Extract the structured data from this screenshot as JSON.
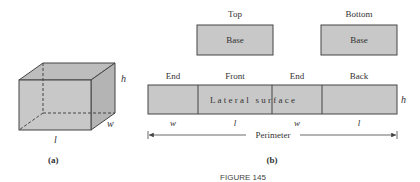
{
  "figure": {
    "caption": "FIGURE 145",
    "colors": {
      "fill": "#c8c8c8",
      "stroke": "#444444",
      "text": "#333333"
    }
  },
  "panel_a": {
    "label": "(a)",
    "dims": {
      "length": "l",
      "width": "w",
      "height": "h"
    }
  },
  "panel_b": {
    "label": "(b)",
    "top": {
      "title": "Top",
      "label": "Base"
    },
    "bottom": {
      "title": "Bottom",
      "label": "Base"
    },
    "strip": {
      "sections": [
        {
          "title": "End",
          "dim": "w"
        },
        {
          "title": "Front",
          "dim": "l"
        },
        {
          "title": "End",
          "dim": "w"
        },
        {
          "title": "Back",
          "dim": "l"
        }
      ],
      "center_text": "L a t e r a l   s u r f a c e",
      "height_label": "h"
    },
    "perimeter_label": "Perimeter"
  }
}
